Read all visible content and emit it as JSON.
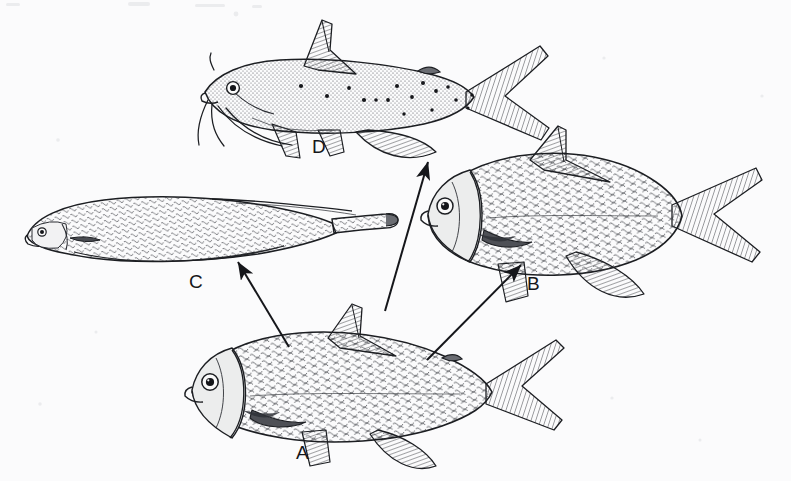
{
  "plate": {
    "kind": "scientific-illustration",
    "subject": "fish-body-form-divergence",
    "background_color": "#fbfbfc",
    "ink_color": "#15161a",
    "width": 791,
    "height": 481
  },
  "figures": [
    {
      "key": "A",
      "label": "A",
      "label_x": 296,
      "label_y": 443,
      "name": "generalized-ancestral-fish",
      "description": "Generalized deep-bodied scaled fish, bottom center; source of all three arrows",
      "body_color": "#5a5c63",
      "position": "bottom-center"
    },
    {
      "key": "B",
      "label": "B",
      "label_x": 527,
      "label_y": 274,
      "name": "deep-bodied-fish",
      "description": "Deep-bodied bream-like fish with tall dorsal fin and forked tail, right middle",
      "body_color": "#5a5c63",
      "position": "right-middle"
    },
    {
      "key": "C",
      "label": "C",
      "label_x": 189,
      "label_y": 272,
      "name": "elongate-fish",
      "description": "Elongate eel-like fish with long tapering tail, left middle",
      "body_color": "#5a5c63",
      "position": "left-middle"
    },
    {
      "key": "D",
      "label": "D",
      "label_x": 312,
      "label_y": 137,
      "name": "catfish",
      "description": "Spotted catfish with barbels, adipose fin and deeply forked tail, top center",
      "body_color": "#4c4e55",
      "position": "top-center"
    }
  ],
  "arrows": [
    {
      "name": "arrow-a-to-c",
      "from": "A",
      "to": "C",
      "x1": 289,
      "y1": 347,
      "x2": 238,
      "y2": 262
    },
    {
      "name": "arrow-a-to-d",
      "from": "A",
      "to": "D",
      "x1": 385,
      "y1": 311,
      "x2": 428,
      "y2": 162
    },
    {
      "name": "arrow-a-to-b",
      "from": "A",
      "to": "B",
      "x1": 427,
      "y1": 360,
      "x2": 521,
      "y2": 265
    }
  ]
}
